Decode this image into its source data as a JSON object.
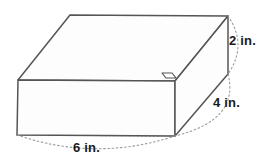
{
  "figure": {
    "name": "rectangular-prism-diagram",
    "shape": "rectangular prism",
    "unit": "in.",
    "stroke_color": "#555555",
    "hidden_edge_color": "#9a9a9a",
    "arc_color": "#9a9a9a",
    "background_color": "#ffffff",
    "text_color": "#1a1a1a"
  },
  "labels": {
    "height": "2 in.",
    "depth": "4 in.",
    "width": "6 in."
  },
  "dimensions": {
    "width_value": 6,
    "depth_value": 4,
    "height_value": 2,
    "unit": "in."
  },
  "markers": {
    "right_angle_marker": "right-angle-notch"
  }
}
